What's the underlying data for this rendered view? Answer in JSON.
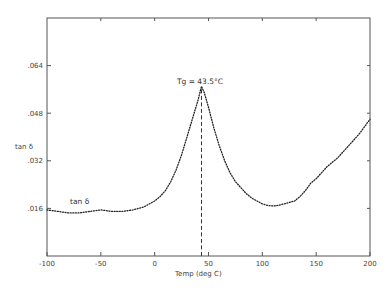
{
  "chart_data": {
    "type": "line",
    "title": "",
    "xlabel": "Temp (deg C)",
    "ylabel": "tan δ",
    "xlim": [
      -100,
      200
    ],
    "ylim": [
      0.0,
      0.08
    ],
    "x_ticks": [
      -100,
      -50,
      0,
      50,
      100,
      150,
      200
    ],
    "x_tick_labels": [
      "-100",
      "-50",
      "0",
      "50",
      "100",
      "150",
      "200"
    ],
    "y_ticks": [
      0.016,
      0.032,
      0.048,
      0.064
    ],
    "y_tick_labels": [
      ".016",
      ".032",
      ".048",
      ".064"
    ],
    "grid": false,
    "legend": null,
    "series": [
      {
        "name": "tan δ",
        "style": "dotted",
        "x": [
          -100,
          -90,
          -80,
          -70,
          -60,
          -50,
          -40,
          -30,
          -20,
          -10,
          0,
          5,
          10,
          15,
          20,
          25,
          30,
          35,
          40,
          43.5,
          46,
          50,
          55,
          60,
          65,
          70,
          75,
          80,
          85,
          90,
          95,
          100,
          105,
          110,
          115,
          120,
          125,
          130,
          135,
          140,
          145,
          150,
          160,
          170,
          180,
          190,
          200
        ],
        "values": [
          0.0155,
          0.015,
          0.0145,
          0.0145,
          0.015,
          0.0155,
          0.015,
          0.015,
          0.0155,
          0.0165,
          0.0185,
          0.02,
          0.022,
          0.025,
          0.029,
          0.034,
          0.04,
          0.046,
          0.052,
          0.057,
          0.055,
          0.05,
          0.043,
          0.037,
          0.032,
          0.028,
          0.025,
          0.023,
          0.021,
          0.0195,
          0.0185,
          0.0175,
          0.017,
          0.0168,
          0.017,
          0.0175,
          0.018,
          0.0185,
          0.02,
          0.022,
          0.0245,
          0.026,
          0.03,
          0.033,
          0.037,
          0.041,
          0.046
        ]
      }
    ],
    "annotations": [
      {
        "text": "Tg = 43.5°C",
        "x": 43.5,
        "y": 0.058,
        "type": "label"
      },
      {
        "text": "",
        "type": "vline-dashed",
        "x": 43.5,
        "y_from": 0.0,
        "y_to": 0.056
      },
      {
        "text": "tan δ",
        "x": -70,
        "y": 0.0175,
        "type": "label"
      }
    ]
  },
  "labels": {
    "ylabel": "tan δ",
    "xlabel": "Temp (deg C)",
    "tg": "Tg = 43.5°C",
    "curve_label": "tan δ",
    "x_ticks": [
      "-100",
      "-50",
      "0",
      "50",
      "100",
      "150",
      "200"
    ],
    "y_ticks": [
      ".016",
      ".032",
      ".048",
      ".064"
    ]
  }
}
